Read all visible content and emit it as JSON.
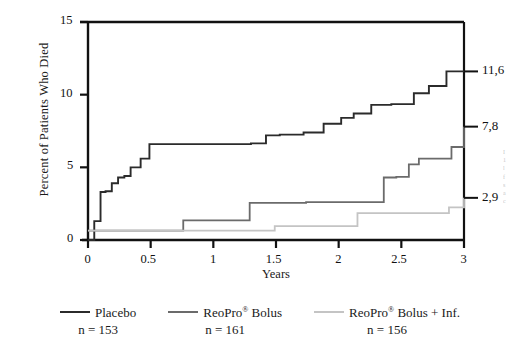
{
  "chart_data": {
    "type": "line",
    "subtype": "kaplan-meier-step",
    "title": "",
    "xlabel": "Years",
    "ylabel": "Percent of Patients Who Died",
    "xlim": [
      0,
      3
    ],
    "ylim": [
      0,
      15
    ],
    "xticks": [
      0,
      0.5,
      1,
      1.5,
      2,
      2.5,
      3
    ],
    "xtick_labels": [
      "0",
      "0.5",
      "1",
      "1.5",
      "2",
      "2.5",
      "3"
    ],
    "yticks": [
      0,
      5,
      10,
      15
    ],
    "ytick_labels": [
      "0",
      "5",
      "10",
      "15"
    ],
    "grid": false,
    "legend_position": "bottom",
    "series": [
      {
        "name": "Placebo",
        "n_label": "n = 153",
        "color": "#2b2b2b",
        "end_value": 11.6,
        "end_label": "11,6",
        "x": [
          0.0,
          0.05,
          0.1,
          0.14,
          0.19,
          0.24,
          0.29,
          0.34,
          0.42,
          0.49,
          1.3,
          1.42,
          1.53,
          1.72,
          1.88,
          2.02,
          2.12,
          2.26,
          2.42,
          2.6,
          2.72,
          2.86,
          3.0
        ],
        "y": [
          0.0,
          1.3,
          3.3,
          3.35,
          3.9,
          4.3,
          4.4,
          5.0,
          5.6,
          6.6,
          6.65,
          7.2,
          7.25,
          7.4,
          8.0,
          8.4,
          8.7,
          9.3,
          9.35,
          10.1,
          10.6,
          11.6,
          11.6
        ]
      },
      {
        "name": "ReoPro® Bolus",
        "n_label": "n = 161",
        "color": "#6b6b6b",
        "end_value": 7.8,
        "end_label": "7,8",
        "x": [
          0.0,
          0.37,
          0.76,
          0.9,
          1.29,
          1.74,
          2.36,
          2.46,
          2.56,
          2.64,
          2.9,
          3.0
        ],
        "y": [
          0.65,
          0.65,
          1.35,
          1.35,
          2.55,
          2.6,
          4.3,
          4.35,
          5.2,
          5.6,
          6.4,
          7.8
        ]
      },
      {
        "name": "ReoPro® Bolus + Inf.",
        "n_label": "n = 156",
        "color": "#c4c4c4",
        "end_value": 2.9,
        "end_label": "2,9",
        "x": [
          0.0,
          0.35,
          1.49,
          2.15,
          2.88,
          3.0
        ],
        "y": [
          0.65,
          0.65,
          0.95,
          1.85,
          2.25,
          2.9
        ]
      }
    ]
  },
  "axes": {
    "ylabel": "Percent of Patients Who Died",
    "xlabel": "Years",
    "ytick_labels": [
      "15",
      "10",
      "5",
      "0"
    ],
    "xtick_labels": [
      "0",
      "0.5",
      "1",
      "1.5",
      "2",
      "2.5",
      "3"
    ]
  },
  "end_labels": [
    {
      "text": "11,6",
      "value": 11.6
    },
    {
      "text": "7,8",
      "value": 7.8
    },
    {
      "text": "2,9",
      "value": 2.9
    }
  ],
  "legend": {
    "items": [
      {
        "label": "Placebo",
        "n": "n = 153",
        "color": "#2b2b2b",
        "registered": false
      },
      {
        "label": "ReoPro",
        "suffix": " Bolus",
        "n": "n = 161",
        "color": "#6b6b6b",
        "registered": true
      },
      {
        "label": "ReoPro",
        "suffix": " Bolus + Inf.",
        "n": "n = 156",
        "color": "#c4c4c4",
        "registered": true
      }
    ]
  },
  "margin_note": {
    "lines": [
      "I",
      "1",
      "l",
      "f",
      "s",
      "a",
      "c"
    ]
  },
  "colors": {
    "placebo": "#2b2b2b",
    "bolus": "#6b6b6b",
    "bolus_inf": "#c4c4c4",
    "axis": "#111111",
    "background": "#ffffff"
  }
}
